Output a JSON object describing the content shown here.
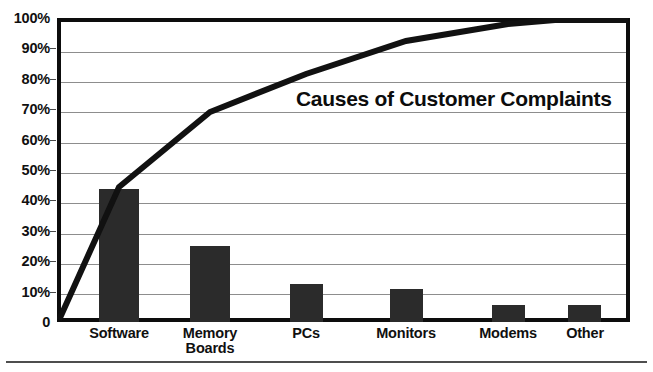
{
  "chart_data": {
    "type": "bar",
    "title": "Causes of Customer Complaints",
    "xlabel": "",
    "ylabel": "",
    "ylim": [
      0,
      100
    ],
    "grid": true,
    "legend": "none",
    "categories": [
      "Software",
      "Memory\nBoards",
      "PCs",
      "Monitors",
      "Modems",
      "Other"
    ],
    "values": [
      44,
      25,
      12.5,
      11,
      5.5,
      5.5
    ],
    "series": [
      {
        "name": "Percent of complaints",
        "type": "bar",
        "values": [
          44,
          25,
          12.5,
          11,
          5.5,
          5.5
        ]
      },
      {
        "name": "Cumulative percent",
        "type": "line",
        "values": [
          44,
          69,
          81.5,
          92.5,
          98,
          100
        ]
      }
    ],
    "y_ticks": [
      "0",
      "10%",
      "20%",
      "30%",
      "40%",
      "50%",
      "60%",
      "70%",
      "80%",
      "90%",
      "100%"
    ],
    "y_tick_values": [
      0,
      10,
      20,
      30,
      40,
      50,
      60,
      70,
      80,
      90,
      100
    ],
    "colors": {
      "bar": "#2b2b2b",
      "line": "#111111",
      "grid": "#8d8d8d",
      "frame": "#0d0d0d",
      "background": "#ffffff",
      "text": "#101010"
    },
    "line_origin_percent": 0
  }
}
